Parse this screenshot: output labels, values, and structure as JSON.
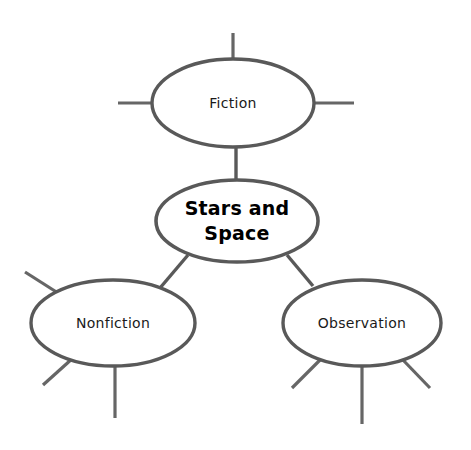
{
  "diagram": {
    "type": "concept-map",
    "background_color": "#ffffff",
    "stroke_color": "#595959",
    "spoke_color": "#666666",
    "text_color": "#1a1a1a",
    "center_text_color": "#000000",
    "width": 471,
    "height": 450,
    "center_node": {
      "id": "center",
      "label_line1": "Stars and",
      "label_line2": "Space",
      "label_full": "Stars and Space",
      "cx": 237,
      "cy": 221,
      "rx": 81,
      "ry": 41
    },
    "nodes": [
      {
        "id": "fiction",
        "label": "Fiction",
        "cx": 233,
        "cy": 103,
        "rx": 81,
        "ry": 44,
        "spokes": [
          {
            "id": "fiction-spoke-top",
            "x1": 233,
            "y1": 33,
            "x2": 233,
            "y2": 60
          },
          {
            "id": "fiction-spoke-left",
            "x1": 118,
            "y1": 103,
            "x2": 153,
            "y2": 103
          },
          {
            "id": "fiction-spoke-right",
            "x1": 313,
            "y1": 103,
            "x2": 354,
            "y2": 103
          }
        ]
      },
      {
        "id": "nonfiction",
        "label": "Nonfiction",
        "cx": 113,
        "cy": 323,
        "rx": 82,
        "ry": 43,
        "spokes": [
          {
            "id": "nonfiction-spoke-upper-left",
            "x1": 25,
            "y1": 272,
            "x2": 58,
            "y2": 293
          },
          {
            "id": "nonfiction-spoke-lower-left",
            "x1": 43,
            "y1": 385,
            "x2": 73,
            "y2": 358
          },
          {
            "id": "nonfiction-spoke-bottom",
            "x1": 115,
            "y1": 366,
            "x2": 115,
            "y2": 418
          }
        ]
      },
      {
        "id": "observation",
        "label": "Observation",
        "cx": 362,
        "cy": 323,
        "rx": 79,
        "ry": 43,
        "spokes": [
          {
            "id": "observation-spoke-lower-left",
            "x1": 292,
            "y1": 388,
            "x2": 320,
            "y2": 360
          },
          {
            "id": "observation-spoke-bottom",
            "x1": 362,
            "y1": 366,
            "x2": 362,
            "y2": 424
          },
          {
            "id": "observation-spoke-lower-right",
            "x1": 430,
            "y1": 388,
            "x2": 403,
            "y2": 360
          }
        ]
      }
    ],
    "connectors": [
      {
        "id": "connector-center-fiction",
        "from": "center",
        "to": "fiction",
        "x1": 236,
        "y1": 147,
        "x2": 236,
        "y2": 181
      },
      {
        "id": "connector-center-nonfiction",
        "from": "center",
        "to": "nonfiction",
        "x1": 188,
        "y1": 255,
        "x2": 160,
        "y2": 288
      },
      {
        "id": "connector-center-observation",
        "from": "center",
        "to": "observation",
        "x1": 287,
        "y1": 255,
        "x2": 313,
        "y2": 286
      }
    ]
  }
}
